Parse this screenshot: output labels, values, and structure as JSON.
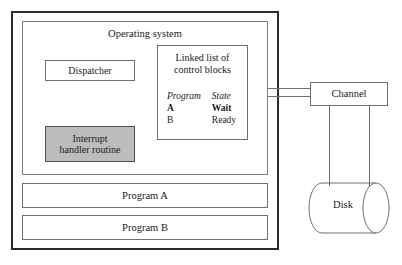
{
  "diagram": {
    "outer_frame": {
      "name": "figure-border"
    },
    "operating_system": {
      "title": "Operating system",
      "dispatcher": {
        "label": "Dispatcher"
      },
      "interrupt_handler": {
        "line1": "Interrupt",
        "line2": "handler routine",
        "fill_color": "#bcbcbc"
      },
      "linked_list": {
        "title_line1": "Linked list of",
        "title_line2": "control blocks",
        "columns": [
          "Program",
          "State"
        ],
        "rows": [
          {
            "program": "A",
            "state": "Wait",
            "emphasis": true
          },
          {
            "program": "B",
            "state": "Ready",
            "emphasis": false
          }
        ]
      }
    },
    "program_a": {
      "label": "Program A"
    },
    "program_b": {
      "label": "Program B"
    },
    "channel": {
      "label": "Channel"
    },
    "disk": {
      "label": "Disk"
    },
    "colors": {
      "frame_stroke": "#2b2b2b",
      "box_stroke": "#6e6e6e",
      "background": "#ffffff",
      "highlight_fill": "#bcbcbc"
    }
  }
}
